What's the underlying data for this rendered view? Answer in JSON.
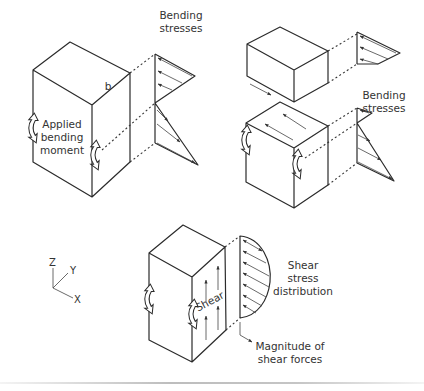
{
  "figure": {
    "panel_bending_tall": {
      "dimension_label": "b",
      "moment_label": [
        "Applied",
        "bending",
        "moment"
      ],
      "stress_label": [
        "Bending",
        "stresses"
      ]
    },
    "panel_bending_right": {
      "stress_label": [
        "Bending",
        "stresses"
      ]
    },
    "panel_shear": {
      "face_label": "Shear",
      "distribution_label": [
        "Shear",
        "stress",
        "distribution"
      ],
      "magnitude_label": [
        "Magnitude of",
        "shear forces"
      ]
    },
    "axes": {
      "z": "Z",
      "y": "Y",
      "x": "X"
    }
  }
}
